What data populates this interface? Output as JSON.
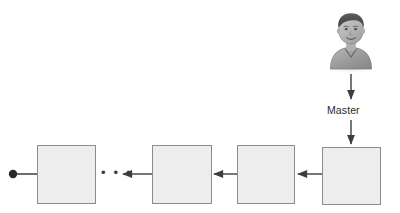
{
  "diagram": {
    "type": "pipeline-chain-diagram",
    "background_color": "#ffffff",
    "actor": {
      "name": "master-user-avatar",
      "icon": "person-avatar-icon",
      "hair_color": "#4c4c4c",
      "face_color": "#b4b4b4",
      "shirt_color": "#9a9a9a",
      "position": {
        "x": 328,
        "y": 8,
        "width": 46,
        "height": 62
      }
    },
    "connector_label": "Master",
    "label_position": {
      "x": 327,
      "y": 104
    },
    "ellipsis": "• • •",
    "ellipsis_position": {
      "x": 101,
      "y": 169
    },
    "box_fill_color": "#ededed",
    "box_border_color": "#8c8c8c",
    "line_color": "#4a4a4a",
    "terminal_dot": {
      "name": "chain-terminal-dot",
      "color": "#2a2a2a",
      "cx": 13,
      "cy": 174,
      "r": 4
    },
    "boxes": [
      {
        "id": "node-1",
        "label": "",
        "x": 37,
        "y": 145,
        "width": 59,
        "height": 59
      },
      {
        "id": "node-2",
        "label": "",
        "x": 152,
        "y": 145,
        "width": 60,
        "height": 59
      },
      {
        "id": "node-3",
        "label": "",
        "x": 237,
        "y": 145,
        "width": 58,
        "height": 59
      },
      {
        "id": "node-4",
        "label": "",
        "x": 322,
        "y": 147,
        "width": 59,
        "height": 58
      }
    ],
    "arrows": [
      {
        "id": "arrow-node2-to-node1",
        "from": "node-2",
        "to": "ellipsis",
        "x1": 152,
        "y1": 174,
        "x2": 122,
        "y2": 174,
        "direction": "left"
      },
      {
        "id": "arrow-node3-to-node2",
        "from": "node-3",
        "to": "node-2",
        "x1": 237,
        "y1": 174,
        "x2": 213,
        "y2": 174,
        "direction": "left"
      },
      {
        "id": "arrow-node4-to-node3",
        "from": "node-4",
        "to": "node-3",
        "x1": 322,
        "y1": 174,
        "x2": 297,
        "y2": 174,
        "direction": "left"
      },
      {
        "id": "arrow-avatar-to-label",
        "from": "avatar",
        "to": "label",
        "x1": 351,
        "y1": 76,
        "x2": 351,
        "y2": 101,
        "direction": "down"
      },
      {
        "id": "arrow-label-to-node4",
        "from": "label",
        "to": "node-4",
        "x1": 351,
        "y1": 120,
        "x2": 351,
        "y2": 145,
        "direction": "down"
      }
    ],
    "terminal_line": {
      "id": "terminal-connector-line",
      "x1": 15,
      "y1": 174,
      "x2": 37,
      "y2": 174
    }
  }
}
